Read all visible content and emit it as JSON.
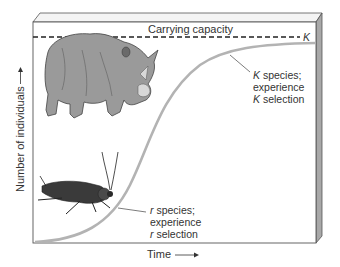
{
  "diagram": {
    "carrying_capacity_label": "Carrying capacity",
    "k_marker": "K",
    "k_annotation": [
      "K species;",
      "experience",
      "K selection"
    ],
    "k_annotation_italic_letters": [
      "K",
      "K"
    ],
    "r_annotation": [
      "r species;",
      "experience",
      "r selection"
    ],
    "x_axis_label": "Time",
    "y_axis_label": "Number of individuals",
    "curve_type": "logistic (S-shaped)",
    "illustrations": [
      "rhinoceros-icon",
      "cockroach-icon"
    ],
    "colors": {
      "curve": "#b3b3b3",
      "frame": "#555555",
      "side_face": "#a8a8a8",
      "rhino": "#9a9a9a",
      "insect": "#3a3a3a",
      "text": "#333333"
    }
  }
}
